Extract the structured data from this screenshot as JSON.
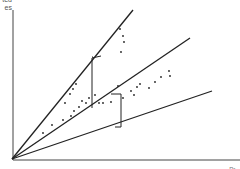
{
  "chart": {
    "y_axis_label_line1": "ted",
    "y_axis_label_line2": "es",
    "x_axis_label": "Pr..."
  },
  "chart_data": {
    "type": "scatter",
    "title": "",
    "xlabel": "(cropped)",
    "ylabel": "(cropped) ...ted ...es",
    "lines_from_origin": [
      {
        "name": "upper",
        "x1": 12,
        "y1": 159,
        "x2": 133,
        "y2": 10
      },
      {
        "name": "middle",
        "x1": 12,
        "y1": 159,
        "x2": 190,
        "y2": 38
      },
      {
        "name": "lower",
        "x1": 12,
        "y1": 159,
        "x2": 212,
        "y2": 91
      }
    ],
    "points": [
      [
        43,
        133
      ],
      [
        52,
        125
      ],
      [
        63,
        120
      ],
      [
        71,
        116
      ],
      [
        74,
        111
      ],
      [
        79,
        107
      ],
      [
        82,
        101
      ],
      [
        86,
        103
      ],
      [
        89,
        98
      ],
      [
        95,
        95
      ],
      [
        99,
        103
      ],
      [
        103,
        103
      ],
      [
        111,
        102
      ],
      [
        123,
        98
      ],
      [
        131,
        91
      ],
      [
        134,
        95
      ],
      [
        137,
        87
      ],
      [
        140,
        84
      ],
      [
        149,
        88
      ],
      [
        155,
        82
      ],
      [
        161,
        77
      ],
      [
        169,
        71
      ],
      [
        170,
        76
      ],
      [
        118,
        86
      ],
      [
        121,
        52
      ],
      [
        123,
        36
      ],
      [
        124,
        42
      ],
      [
        120,
        29
      ],
      [
        65,
        103
      ],
      [
        70,
        94
      ],
      [
        73,
        89
      ],
      [
        76,
        84
      ]
    ],
    "brackets": [
      {
        "x": 92,
        "y_top": 57,
        "y_bottom": 108,
        "tick_right_top": 104,
        "tick_right_bottom": 92
      },
      {
        "x": 121,
        "y_top": 94,
        "y_bottom": 127
      }
    ],
    "colors": {
      "lines": "#222222",
      "points": "#222222",
      "axes": "#444444"
    }
  }
}
